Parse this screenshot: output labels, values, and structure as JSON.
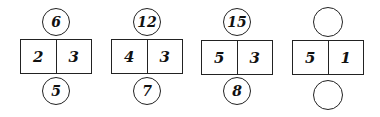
{
  "puzzle": {
    "groups": [
      {
        "top": "6",
        "left": "2",
        "right": "3",
        "bottom": "5"
      },
      {
        "top": "12",
        "left": "4",
        "right": "3",
        "bottom": "7"
      },
      {
        "top": "15",
        "left": "5",
        "right": "3",
        "bottom": "8"
      },
      {
        "top": "",
        "left": "5",
        "right": "1",
        "bottom": ""
      }
    ]
  }
}
